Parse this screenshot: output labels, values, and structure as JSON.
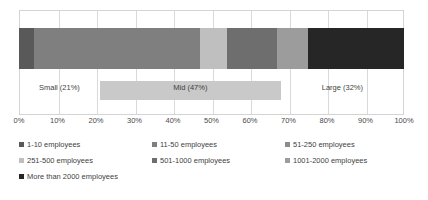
{
  "chart_data": {
    "type": "bar",
    "title": "",
    "subtitle": "",
    "xlabel": "",
    "ylabel": "",
    "orientation": "horizontal",
    "stacked": true,
    "normalized_percent": true,
    "grid": true,
    "legend_position": "bottom",
    "xlim": [
      0,
      100
    ],
    "x_tick_labels": [
      "0%",
      "10%",
      "20%",
      "30%",
      "40%",
      "50%",
      "60%",
      "70%",
      "80%",
      "90%",
      "100%"
    ],
    "x_tick_values": [
      0,
      10,
      20,
      30,
      40,
      50,
      60,
      70,
      80,
      90,
      100
    ],
    "categories": [
      "All respondents"
    ],
    "series": [
      {
        "name": "1-10 employees",
        "values": [
          4
        ],
        "color": "#595959"
      },
      {
        "name": "11-50 employees",
        "values": [
          43
        ],
        "color": "#7f7f7f"
      },
      {
        "name": "51-250 employees",
        "values": [
          0
        ],
        "color": "#8c8c8c"
      },
      {
        "name": "251-500 employees",
        "values": [
          7
        ],
        "color": "#bfbfbf"
      },
      {
        "name": "501-1000 employees",
        "values": [
          13
        ],
        "color": "#6e6e6e"
      },
      {
        "name": "1001-2000 employees",
        "values": [
          8
        ],
        "color": "#9c9c9c"
      },
      {
        "name": "More than 2000 employees",
        "values": [
          25
        ],
        "color": "#262626"
      }
    ],
    "annotations": [
      {
        "label": "Small (21%)",
        "start": 0,
        "end": 21,
        "value": 21,
        "band_color": "#ffffff"
      },
      {
        "label": "Mid (47%)",
        "start": 21,
        "end": 68,
        "value": 47,
        "band_color": "#c9c9c9"
      },
      {
        "label": "Large (32%)",
        "start": 68,
        "end": 100,
        "value": 32,
        "band_color": "#ffffff"
      }
    ]
  },
  "legend": {
    "rows": [
      [
        {
          "label": "1-10 employees",
          "color": "#595959"
        },
        {
          "label": "11-50 employees",
          "color": "#7f7f7f"
        },
        {
          "label": "51-250 employees",
          "color": "#8c8c8c"
        }
      ],
      [
        {
          "label": "251-500 employees",
          "color": "#bfbfbf"
        },
        {
          "label": "501-1000 employees",
          "color": "#6e6e6e"
        },
        {
          "label": "1001-2000 employees",
          "color": "#9c9c9c"
        }
      ],
      [
        {
          "label": "More than 2000 employees",
          "color": "#262626"
        }
      ]
    ]
  },
  "colors": {
    "plot_background": "#ffffff",
    "gridline": "#d9d9d9",
    "frame": "#d4d4d4",
    "text": "#3f3f3f"
  }
}
